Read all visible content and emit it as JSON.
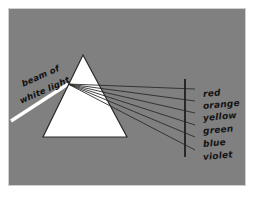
{
  "figure": {
    "background_color": "#808080",
    "frame_color": "#cfcfcf",
    "ink_color": "#1c1c1c",
    "prism_fill": "#ffffff",
    "beam_color": "#ffffff"
  },
  "beam_label": {
    "line1": "beam of",
    "line2": "white light"
  },
  "spectrum": {
    "labels": [
      {
        "name": "red",
        "color_hex": "#d93025"
      },
      {
        "name": "orange",
        "color_hex": "#e8710a"
      },
      {
        "name": "yellow",
        "color_hex": "#f2c200"
      },
      {
        "name": "green",
        "color_hex": "#1e8e3e"
      },
      {
        "name": "blue",
        "color_hex": "#1a73e8"
      },
      {
        "name": "violet",
        "color_hex": "#7b2ff7"
      }
    ]
  },
  "geometry": {
    "prism": {
      "apex": [
        74,
        46
      ],
      "base_left": [
        34,
        128
      ],
      "base_right": [
        118,
        128
      ]
    },
    "dispersion_point": [
      59,
      75
    ],
    "incoming_beam": {
      "start": [
        2,
        112
      ],
      "end": [
        59,
        75
      ],
      "width": 3
    },
    "screen": {
      "x": 176,
      "y_top": 70,
      "y_bottom": 148
    },
    "rays": [
      {
        "name": "red",
        "end": [
          186,
          80
        ]
      },
      {
        "name": "orange",
        "end": [
          186,
          92
        ]
      },
      {
        "name": "yellow",
        "end": [
          186,
          104
        ]
      },
      {
        "name": "green",
        "end": [
          186,
          116
        ]
      },
      {
        "name": "blue",
        "end": [
          186,
          128
        ]
      },
      {
        "name": "violet",
        "end": [
          186,
          141
        ]
      }
    ]
  }
}
